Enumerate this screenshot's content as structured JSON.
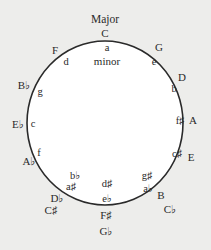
{
  "diagram": {
    "title_major": "Major",
    "title_minor_top": "a",
    "title_minor_word": "minor",
    "colors": {
      "background": "#ededeb",
      "circle_fill": "#ffffff",
      "circle_stroke": "#2a2a2a",
      "text": "#2a2a2a"
    },
    "circle": {
      "cx": 105,
      "cy": 123,
      "rx": 78,
      "ry": 82
    },
    "major_keys": [
      {
        "label": "C",
        "x": 105,
        "y": 33
      },
      {
        "label": "G",
        "x": 159,
        "y": 47
      },
      {
        "label": "D",
        "x": 182,
        "y": 77
      },
      {
        "label": "A",
        "x": 193,
        "y": 120
      },
      {
        "label": "E",
        "x": 191,
        "y": 157
      },
      {
        "label": "B",
        "x": 161,
        "y": 195
      },
      {
        "label": "C♭",
        "x": 170,
        "y": 209
      },
      {
        "label": "F♯",
        "x": 106,
        "y": 215
      },
      {
        "label": "G♭",
        "x": 106,
        "y": 231
      },
      {
        "label": "D♭",
        "x": 57,
        "y": 198
      },
      {
        "label": "C♯",
        "x": 51,
        "y": 210
      },
      {
        "label": "A♭",
        "x": 29,
        "y": 161
      },
      {
        "label": "E♭",
        "x": 18,
        "y": 124
      },
      {
        "label": "B♭",
        "x": 24,
        "y": 85
      },
      {
        "label": "F",
        "x": 55,
        "y": 50
      }
    ],
    "minor_keys": [
      {
        "label": "e",
        "x": 154,
        "y": 61
      },
      {
        "label": "b",
        "x": 174,
        "y": 88
      },
      {
        "label": "f♯",
        "x": 180,
        "y": 120
      },
      {
        "label": "c♯",
        "x": 177,
        "y": 153
      },
      {
        "label": "g♯",
        "x": 147,
        "y": 175
      },
      {
        "label": "a♭",
        "x": 148,
        "y": 188
      },
      {
        "label": "d♯",
        "x": 107,
        "y": 183
      },
      {
        "label": "e♭",
        "x": 107,
        "y": 198
      },
      {
        "label": "b♭",
        "x": 75,
        "y": 175
      },
      {
        "label": "a♯",
        "x": 71,
        "y": 186
      },
      {
        "label": "f",
        "x": 39,
        "y": 152
      },
      {
        "label": "c",
        "x": 33,
        "y": 123
      },
      {
        "label": "g",
        "x": 40,
        "y": 91
      },
      {
        "label": "d",
        "x": 66,
        "y": 61
      }
    ]
  }
}
